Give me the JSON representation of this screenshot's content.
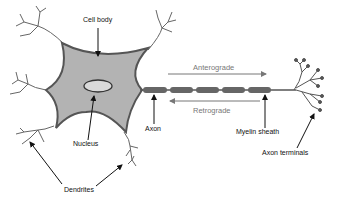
{
  "diagram": {
    "labels": {
      "cell_body": "Cell body",
      "nucleus": "Nucleus",
      "dendrites": "Dendrites",
      "axon": "Axon",
      "myelin_sheath": "Myelin sheath",
      "axon_terminals": "Axon terminals",
      "anterograde": "Anterograde",
      "retrograde": "Retrograde"
    },
    "colors": {
      "cell_fill": "#b3b3b3",
      "outline": "#555555",
      "nucleus_fill": "#d9d9d9",
      "myelin": "#666666",
      "arrow": "#111111",
      "transport_arrow": "#777777",
      "background": "#ffffff"
    },
    "myelin_segment_count": 6
  }
}
